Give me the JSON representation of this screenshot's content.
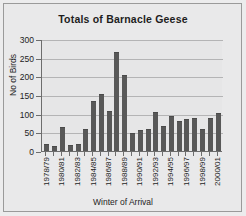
{
  "chart_data": {
    "type": "bar",
    "title": "Totals of Barnacle Geese",
    "xlabel": "Winter of Arrival",
    "ylabel": "No of Birds",
    "ylim": [
      0,
      300
    ],
    "yticks": [
      0,
      50,
      100,
      150,
      200,
      250,
      300
    ],
    "ytick_labels": [
      "0",
      "50",
      "100",
      "150",
      "200",
      "250",
      "300"
    ],
    "grid": true,
    "legend": false,
    "label_interval": 2,
    "categories": [
      "1978/79",
      "1979/80",
      "1980/81",
      "1981/82",
      "1982/83",
      "1983/84",
      "1984/85",
      "1985/86",
      "1986/87",
      "1987/88",
      "1988/89",
      "1989/90",
      "1990/91",
      "1991/92",
      "1992/93",
      "1993/94",
      "1994/95",
      "1995/96",
      "1996/97",
      "1997/98",
      "1998/99",
      "1999/00",
      "2000/01"
    ],
    "tick_labels": [
      "1978/79",
      "",
      "1980/81",
      "",
      "1982/83",
      "",
      "1984/85",
      "",
      "1986/87",
      "",
      "1988/89",
      "",
      "1990/91",
      "",
      "1992/93",
      "",
      "1994/95",
      "",
      "1996/97",
      "",
      "1998/99",
      "",
      "2000/01"
    ],
    "values": [
      20,
      13,
      63,
      15,
      18,
      58,
      135,
      153,
      107,
      265,
      203,
      49,
      55,
      60,
      105,
      66,
      94,
      80,
      87,
      89,
      58,
      89,
      101
    ],
    "colors": {
      "bar": "#585858",
      "background": "#e9e9ea",
      "plot_background": "#e6e6e7",
      "gridline": "#b4b4b5",
      "axis": "#6d6d6d",
      "text": "#1d1d1d",
      "border": "#9a9a9a"
    }
  }
}
